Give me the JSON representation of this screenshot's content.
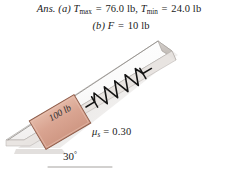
{
  "answer": {
    "prefix": "Ans.",
    "part_a": {
      "marker": "(a)",
      "sym1": "T",
      "sub1": "max",
      "eq1": "=",
      "val1": "76.0 lb,",
      "sym2": "T",
      "sub2": "min",
      "eq2": "=",
      "val2": "24.0 lb"
    },
    "part_b": {
      "marker": "(b)",
      "sym": "F",
      "eq": "=",
      "val": "10 lb"
    }
  },
  "figure": {
    "type": "inclined-plane-spring-block",
    "block_label": "100 lb",
    "friction_label": {
      "symbol": "μ",
      "subscript": "s",
      "equals": "=",
      "value": "0.30"
    },
    "angle_label": {
      "value": "30",
      "unit": "°"
    },
    "incline_angle_deg": 30,
    "colors": {
      "block_fill": "#d8a08d",
      "block_fill_light": "#e3b6a4",
      "block_edge": "#8d5c4a",
      "ramp_fill": "#fbfbfb",
      "ramp_edge": "#a9a5a2",
      "ramp_side": "#cfcac6",
      "shadow": "#b9b2ad",
      "spring": "#141414",
      "text": "#1a1a1a"
    }
  }
}
